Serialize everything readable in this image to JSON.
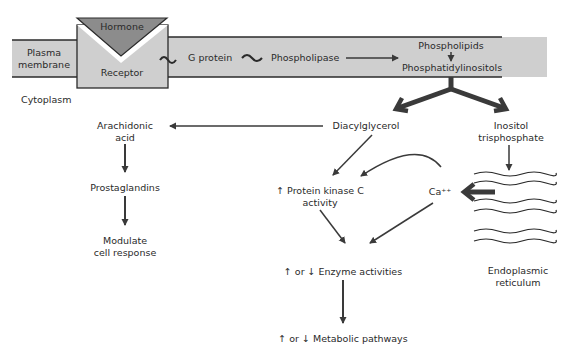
{
  "membrane": {
    "label_line1": "Plasma",
    "label_line2": "membrane",
    "band_color": "#cfcfcf",
    "line_color": "#2a2a2a"
  },
  "hormone": {
    "label": "Hormone",
    "color": "#8c8c8c"
  },
  "receptor": {
    "label": "Receptor",
    "color": "#cfcfcf"
  },
  "cytoplasm": {
    "label": "Cytoplasm"
  },
  "membrane_flow": {
    "g_protein": "G protein",
    "phospholipase": "Phospholipase",
    "tilde": "~",
    "phospholipids": "Phospholipids",
    "phosphatidylinositols": "Phosphatidylinositols"
  },
  "nodes": {
    "arachidonic_line1": "Arachidonic",
    "arachidonic_line2": "acid",
    "prostaglandins": "Prostaglandins",
    "modulate_line1": "Modulate",
    "modulate_line2": "cell response",
    "diacylglycerol": "Diacylglycerol",
    "inositol_line1": "Inositol",
    "inositol_line2": "trisphosphate",
    "pkc_line1": "↑ Protein kinase C",
    "pkc_line2": "activity",
    "calcium": "Ca⁺⁺",
    "enzyme": "↑ or ↓ Enzyme activities",
    "metabolic": "↑ or ↓ Metabolic pathways",
    "er_line1": "Endoplasmic",
    "er_line2": "reticulum"
  },
  "colors": {
    "arrow": "#3a3a3a",
    "text": "#2a2a2a"
  }
}
